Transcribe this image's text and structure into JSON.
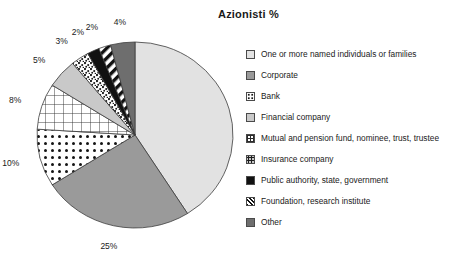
{
  "chart_data": {
    "type": "pie",
    "title": "Azionisti %",
    "xlabel": "",
    "ylabel": "",
    "legend_position": "right",
    "grid": false,
    "start_angle_deg": 0,
    "direction": "clockwise",
    "categories": [
      "One or more named individuals or families",
      "Corporate",
      "Bank",
      "Financial company",
      "Mutual and pension fund, nominee, trust, trustee",
      "Insurance company",
      "Public authority, state, government",
      "Foundation, research institute",
      "Other"
    ],
    "values": [
      41,
      25,
      10,
      8,
      5,
      3,
      2,
      2,
      4
    ],
    "data_labels": [
      "41%",
      "25%",
      "10%",
      "8%",
      "5%",
      "3%",
      "2%",
      "2%",
      "4%"
    ],
    "slice_fills": [
      "light-gray-solid",
      "medium-gray-solid",
      "polka-dot",
      "crosshatch-grid",
      "pale-gray-solid",
      "speckle",
      "black-solid",
      "diagonal-stripe",
      "dark-gray-solid"
    ],
    "colors": {
      "light_gray": "#e2e2e2",
      "medium_gray": "#9a9a9a",
      "pale_gray": "#c9c9c9",
      "dark_gray": "#6e6e6e",
      "black": "#111111",
      "white": "#ffffff",
      "outline": "#3c3c3c",
      "text": "#1a1a1a"
    }
  },
  "legend": {
    "items": [
      {
        "label": "One or more named individuals or families",
        "swatch": "light-gray-solid"
      },
      {
        "label": "Corporate",
        "swatch": "medium-gray-solid"
      },
      {
        "label": "Bank",
        "swatch": "polka-dot"
      },
      {
        "label": "Financial company",
        "swatch": "pale-gray-solid"
      },
      {
        "label": "Mutual and pension fund, nominee, trust, trustee",
        "swatch": "crosshatch-grid"
      },
      {
        "label": "Insurance company",
        "swatch": "speckle"
      },
      {
        "label": "Public authority, state, government",
        "swatch": "black-solid"
      },
      {
        "label": "Foundation, research institute",
        "swatch": "diagonal-stripe"
      },
      {
        "label": "Other",
        "swatch": "dark-gray-solid"
      }
    ]
  }
}
